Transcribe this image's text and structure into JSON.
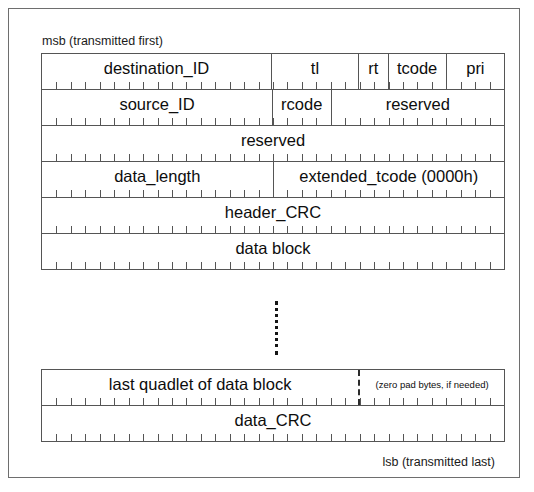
{
  "diagram": {
    "title_top": "msb (transmitted first)",
    "title_bottom": "lsb (transmitted last)",
    "bits_per_row": 32,
    "header_table": {
      "rows": [
        {
          "name": "row-destination",
          "fields": [
            {
              "label": "destination_ID",
              "bits": 16
            },
            {
              "label": "tl",
              "bits": 6
            },
            {
              "label": "rt",
              "bits": 2
            },
            {
              "label": "tcode",
              "bits": 4
            },
            {
              "label": "pri",
              "bits": 4
            }
          ]
        },
        {
          "name": "row-source",
          "fields": [
            {
              "label": "source_ID",
              "bits": 16
            },
            {
              "label": "rcode",
              "bits": 4
            },
            {
              "label": "reserved",
              "bits": 12
            }
          ]
        },
        {
          "name": "row-reserved",
          "fields": [
            {
              "label": "reserved",
              "bits": 32
            }
          ]
        },
        {
          "name": "row-data-length",
          "fields": [
            {
              "label": "data_length",
              "bits": 16
            },
            {
              "label": "extended_tcode (0000h)",
              "bits": 16
            }
          ]
        },
        {
          "name": "row-header-crc",
          "fields": [
            {
              "label": "header_CRC",
              "bits": 32
            }
          ]
        },
        {
          "name": "row-data-block",
          "fields": [
            {
              "label": "data block",
              "bits": 32
            }
          ]
        }
      ]
    },
    "trailer_table": {
      "rows": [
        {
          "name": "row-last-quadlet",
          "fields": [
            {
              "label": "last quadlet of data block",
              "bits": 22
            },
            {
              "label": "(zero pad bytes, if needed)",
              "bits": 10,
              "small": true,
              "dashed": true
            }
          ]
        },
        {
          "name": "row-data-crc",
          "fields": [
            {
              "label": "data_CRC",
              "bits": 32
            }
          ]
        }
      ]
    }
  }
}
